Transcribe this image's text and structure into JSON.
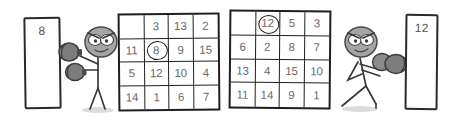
{
  "scene": {
    "title": "two-boxers-number-grids",
    "background_color": "#ffffff",
    "ink_color": "#1f1f1f",
    "number_color": "#6a6a6a",
    "glove_color": "#7a7a7a",
    "head_color": "#9a9a9a"
  },
  "left_panel": {
    "name": "left-score-panel",
    "value": "8"
  },
  "right_panel": {
    "name": "right-score-panel",
    "value": "12"
  },
  "left_grid": {
    "name": "left-number-grid",
    "rows": 4,
    "columns": 4,
    "cells": [
      {
        "value": "",
        "circled": false
      },
      {
        "value": "3",
        "circled": false
      },
      {
        "value": "13",
        "circled": false
      },
      {
        "value": "2",
        "circled": false
      },
      {
        "value": "11",
        "circled": false
      },
      {
        "value": "8",
        "circled": true
      },
      {
        "value": "9",
        "circled": false
      },
      {
        "value": "15",
        "circled": false
      },
      {
        "value": "5",
        "circled": false
      },
      {
        "value": "12",
        "circled": false
      },
      {
        "value": "10",
        "circled": false
      },
      {
        "value": "4",
        "circled": false
      },
      {
        "value": "14",
        "circled": false
      },
      {
        "value": "1",
        "circled": false
      },
      {
        "value": "6",
        "circled": false
      },
      {
        "value": "7",
        "circled": false
      }
    ]
  },
  "right_grid": {
    "name": "right-number-grid",
    "rows": 4,
    "columns": 4,
    "cells": [
      {
        "value": "",
        "circled": false
      },
      {
        "value": "12",
        "circled": true
      },
      {
        "value": "5",
        "circled": false
      },
      {
        "value": "3",
        "circled": false
      },
      {
        "value": "6",
        "circled": false
      },
      {
        "value": "2",
        "circled": false
      },
      {
        "value": "8",
        "circled": false
      },
      {
        "value": "7",
        "circled": false
      },
      {
        "value": "13",
        "circled": false
      },
      {
        "value": "4",
        "circled": false
      },
      {
        "value": "15",
        "circled": false
      },
      {
        "value": "10",
        "circled": false
      },
      {
        "value": "11",
        "circled": false
      },
      {
        "value": "14",
        "circled": false
      },
      {
        "value": "9",
        "circled": false
      },
      {
        "value": "1",
        "circled": false
      }
    ]
  },
  "left_figure": {
    "name": "left-boxer",
    "facing": "left",
    "gloves": 2,
    "expression": "angry"
  },
  "right_figure": {
    "name": "right-boxer",
    "facing": "right",
    "gloves": 2,
    "expression": "angry"
  }
}
